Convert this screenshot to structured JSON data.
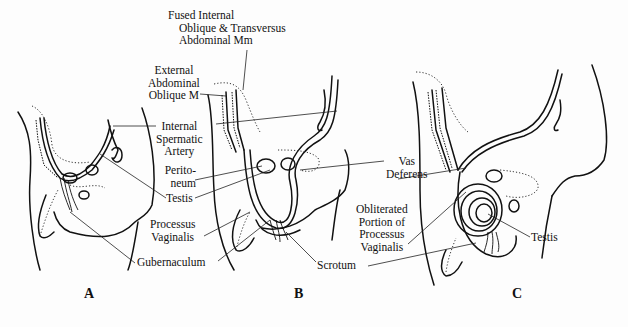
{
  "figure": {
    "panels": [
      {
        "id": "A",
        "label": "A"
      },
      {
        "id": "B",
        "label": "B"
      },
      {
        "id": "C",
        "label": "C"
      }
    ],
    "labels": {
      "fused_internal_oblique": [
        "Fused Internal",
        "Oblique & Transversus",
        "Abdominal Mm"
      ],
      "external_abdominal_oblique": [
        "External",
        "Abdominal",
        "Oblique M"
      ],
      "internal_spermatic_artery": [
        "Internal",
        "Spermatic",
        "Artery"
      ],
      "peritoneum": [
        "Perito-",
        "neum"
      ],
      "testis_ab": "Testis",
      "processus_vaginalis": [
        "Processus",
        "Vaginalis"
      ],
      "gubernaculum": "Gubernaculum",
      "vas_deferens": [
        "Vas",
        "Deferens"
      ],
      "obliterated_pv": [
        "Obliterated",
        "Portion of",
        "Processus",
        "Vaginalis"
      ],
      "scrotum": "Scrotum",
      "testis_c": "Testis"
    }
  }
}
